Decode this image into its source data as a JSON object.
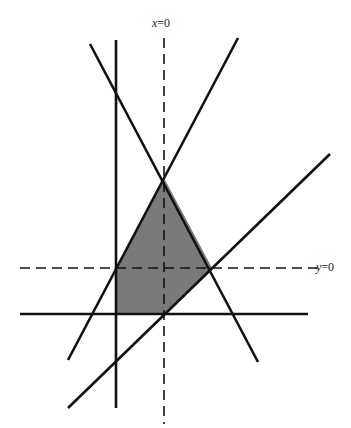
{
  "figure": {
    "type": "feasible-region-diagram",
    "background_color": "#ffffff",
    "line_color": "#111111",
    "region_fill_color": "#7a7a7a",
    "labels": {
      "x_axis_line": {
        "var": "x",
        "rest": "=0"
      },
      "y_axis_line": {
        "var": "y",
        "rest": "=0"
      }
    },
    "dashed_lines": [
      {
        "name": "x-equals-zero",
        "x1": 164,
        "y1": 38,
        "x2": 164,
        "y2": 424
      },
      {
        "name": "y-equals-zero",
        "x1": 20,
        "y1": 268,
        "x2": 318,
        "y2": 268
      }
    ],
    "solid_lines": [
      {
        "name": "vertical-constraint",
        "x1": 116,
        "y1": 40,
        "x2": 116,
        "y2": 408
      },
      {
        "name": "horizontal-constraint",
        "x1": 20,
        "y1": 314,
        "x2": 308,
        "y2": 314
      },
      {
        "name": "descending-constraint",
        "x1": 90,
        "y1": 44,
        "x2": 258,
        "y2": 362
      },
      {
        "name": "ascending-constraint-steep",
        "x1": 238,
        "y1": 38,
        "x2": 68,
        "y2": 360
      },
      {
        "name": "ascending-constraint-shallow",
        "x1": 68,
        "y1": 408,
        "x2": 330,
        "y2": 154
      }
    ],
    "feasible_region": {
      "points": "164,178 212,268 164,314 116,314 116,268"
    }
  }
}
